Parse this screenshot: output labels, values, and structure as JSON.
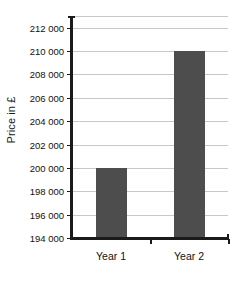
{
  "chart_data": {
    "type": "bar",
    "title": "",
    "subtitle": "",
    "xlabel": "",
    "ylabel": "Price in £",
    "categories": [
      "Year 1",
      "Year 2"
    ],
    "values": [
      200000,
      210000
    ],
    "series": [
      {
        "name": "Price",
        "values": [
          200000,
          210000
        ]
      }
    ],
    "ylim": [
      194000,
      213000
    ],
    "ytick_values": [
      194000,
      196000,
      198000,
      200000,
      202000,
      204000,
      206000,
      208000,
      210000,
      212000
    ],
    "ytick_labels": [
      "194 000",
      "196 000",
      "198 000",
      "200 000",
      "202 000",
      "204 000",
      "206 000",
      "208 000",
      "210 000",
      "212 000"
    ],
    "grid": true,
    "grid_axis": "y",
    "legend": false,
    "legend_position": "none",
    "bar_color": "#4d4d4d",
    "gridline_color": "#c8c8c8",
    "axis_color": "#1a1a1a",
    "background_color": "#ffffff",
    "annotations": []
  },
  "axes": {
    "y_title": "Price in £",
    "y_ticks": [
      {
        "label": "212 000",
        "value": 212000
      },
      {
        "label": "210 000",
        "value": 210000
      },
      {
        "label": "208 000",
        "value": 208000
      },
      {
        "label": "206 000",
        "value": 206000
      },
      {
        "label": "204 000",
        "value": 204000
      },
      {
        "label": "202 000",
        "value": 202000
      },
      {
        "label": "200 000",
        "value": 200000
      },
      {
        "label": "198 000",
        "value": 198000
      },
      {
        "label": "196 000",
        "value": 196000
      },
      {
        "label": "194 000",
        "value": 194000
      }
    ],
    "x_ticks": [
      {
        "label": "Year 1"
      },
      {
        "label": "Year 2"
      }
    ]
  }
}
